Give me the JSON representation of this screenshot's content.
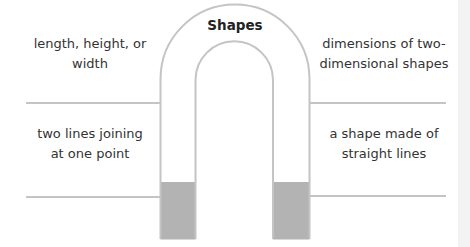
{
  "diagram": {
    "title": "Shapes",
    "type": "magnet-graphic-organizer",
    "labels": {
      "top_left": "length, height, or width",
      "top_right": "dimensions of two-dimensional shapes",
      "bottom_left": "two lines joining at one point",
      "bottom_right": "a shape made of straight lines"
    },
    "top_left_lines": [
      "length, height, or",
      "width"
    ],
    "top_right_lines": [
      "dimensions of two-",
      "dimensional shapes"
    ],
    "bottom_left_lines": [
      "two lines joining",
      "at one point"
    ],
    "bottom_right_lines": [
      "a shape made of",
      "straight lines"
    ],
    "colors": {
      "outline": "#c4c4c4",
      "pole_fill": "#b3b3b3",
      "background": "#ffffff",
      "side_strip": "#f3f3f3"
    }
  }
}
